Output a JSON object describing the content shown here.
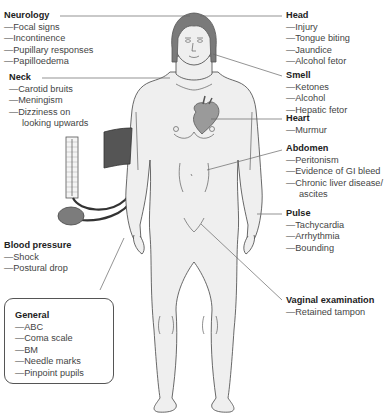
{
  "labels": {
    "neurology": {
      "title": "Neurology",
      "items": [
        "Focal signs",
        "Incontinence",
        "Pupillary responses",
        "Papilloedema"
      ]
    },
    "neck": {
      "title": "Neck",
      "items": [
        "Carotid bruits",
        "Meningism",
        "Dizziness on"
      ],
      "continuation": "looking upwards"
    },
    "blood_pressure": {
      "title": "Blood pressure",
      "items": [
        "Shock",
        "Postural drop"
      ]
    },
    "general": {
      "title": "General",
      "items": [
        "ABC",
        "Coma scale",
        "BM",
        "Needle marks",
        "Pinpoint pupils"
      ]
    },
    "head": {
      "title": "Head",
      "items": [
        "Injury",
        "Tongue biting",
        "Jaundice",
        "Alcohol fetor"
      ]
    },
    "smell": {
      "title": "Smell",
      "items": [
        "Ketones",
        "Alcohol",
        "Hepatic fetor"
      ]
    },
    "heart": {
      "title": "Heart",
      "items": [
        "Murmur"
      ]
    },
    "abdomen": {
      "title": "Abdomen",
      "items": [
        "Peritonism",
        "Evidence of GI bleed",
        "Chronic liver disease/"
      ],
      "continuation": "ascites"
    },
    "pulse": {
      "title": "Pulse",
      "items": [
        "Tachycardia",
        "Arrhythmia",
        "Bounding"
      ]
    },
    "vaginal_examination": {
      "title": "Vaginal examination",
      "items": [
        "Retained tampon"
      ]
    }
  },
  "colors": {
    "skin": "#efefef",
    "outline": "#444444",
    "hair": "#7a7a7a",
    "cuff": "#555555",
    "heart": "#9a9a9a",
    "leader_line": "#666666"
  }
}
